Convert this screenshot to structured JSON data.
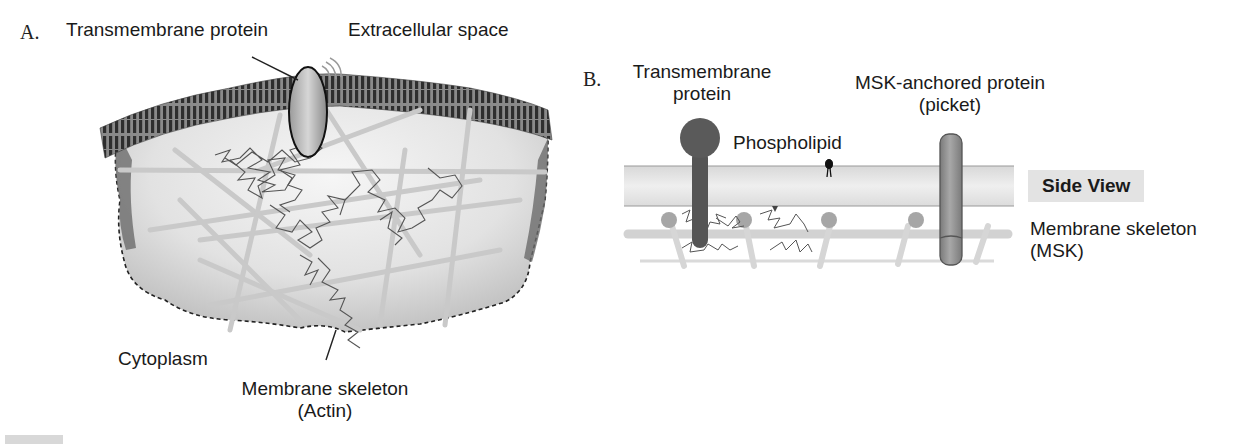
{
  "figure": {
    "panel_a": {
      "letter": "A.",
      "labels": {
        "transmembrane_protein": "Transmembrane protein",
        "extracellular_space": "Extracellular space",
        "cytoplasm": "Cytoplasm",
        "membrane_skeleton_line1": "Membrane skeleton",
        "membrane_skeleton_line2": "(Actin)"
      }
    },
    "panel_b": {
      "letter": "B.",
      "labels": {
        "transmembrane_line1": "Transmembrane",
        "transmembrane_line2": "protein",
        "msk_anchored_line1": "MSK-anchored protein",
        "msk_anchored_line2": "(picket)",
        "phospholipid": "Phospholipid",
        "side_view": "Side View",
        "membrane_skeleton_line1": "Membrane skeleton",
        "membrane_skeleton_line2": "(MSK)"
      }
    },
    "colors": {
      "bilayer_dark": "#4a4a4a",
      "cytoplasm_fill": "#d9d9d9",
      "actin_filament": "#c8c8c8",
      "trajectory": "#555555",
      "tm_protein": "#5a5a5a",
      "picket_protein": "#8c8c8c",
      "membrane_band": "#e4e4e4",
      "side_view_bg": "#e3e3e3"
    }
  }
}
